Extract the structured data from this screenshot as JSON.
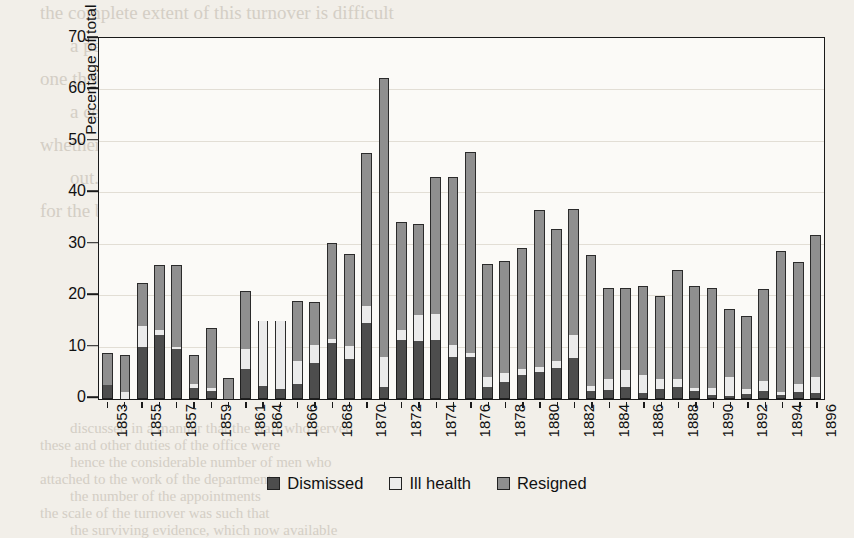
{
  "chart_data": {
    "type": "bar",
    "subtype": "stacked-vertical",
    "title": "",
    "xlabel": "",
    "ylabel": "Percentage of total staff",
    "ylim": [
      0,
      70
    ],
    "ytick_step": 10,
    "yticks": [
      0,
      10,
      20,
      30,
      40,
      50,
      60,
      70
    ],
    "grid": true,
    "grid_axis": "y",
    "legend_position": "bottom",
    "xtick_interval": 2,
    "note_missing_years": [
      1862,
      1863
    ],
    "series": [
      {
        "name": "Dismissed",
        "color": "#4d4d4d",
        "values": [
          2.8,
          0.0,
          10.2,
          12.4,
          9.7,
          2.2,
          1.6,
          0.0,
          5.8,
          2.5,
          2.0,
          3.0,
          7.0,
          10.8,
          7.8,
          14.7,
          2.4,
          11.5,
          11.2,
          11.5,
          8.1,
          8.2,
          2.3,
          3.4,
          4.6,
          5.3,
          6.0,
          8.0,
          1.5,
          1.8,
          2.3,
          1.2,
          2.0,
          2.4,
          1.6,
          0.8,
          0.6,
          1.0,
          1.6,
          0.8,
          1.4,
          1.2
        ]
      },
      {
        "name": "Ill health",
        "color": "#ebebeb",
        "values": [
          0.0,
          1.4,
          4.0,
          1.0,
          0.5,
          0.8,
          0.6,
          0.0,
          4.0,
          12.7,
          13.2,
          4.3,
          3.5,
          0.9,
          2.6,
          3.3,
          5.8,
          2.0,
          5.2,
          5.1,
          2.5,
          0.8,
          2.0,
          1.6,
          1.2,
          1.0,
          1.3,
          4.4,
          1.1,
          2.0,
          3.4,
          3.5,
          1.9,
          1.4,
          0.6,
          1.3,
          3.6,
          1.0,
          2.0,
          0.5,
          1.5,
          3.0
        ]
      },
      {
        "name": "Resigned",
        "color": "#8f8f8f",
        "values": [
          6.2,
          7.1,
          8.3,
          12.6,
          15.8,
          5.5,
          11.6,
          4.0,
          11.2,
          0.0,
          0.0,
          11.7,
          8.3,
          18.6,
          17.8,
          29.8,
          54.3,
          20.9,
          17.6,
          26.6,
          32.6,
          39.0,
          21.9,
          21.8,
          23.6,
          30.4,
          25.8,
          24.6,
          25.4,
          17.8,
          15.9,
          17.3,
          16.1,
          21.2,
          19.8,
          19.4,
          13.3,
          14.2,
          17.7,
          27.5,
          23.7,
          27.7
        ]
      }
    ],
    "categories": [
      "1853",
      "1854",
      "1855",
      "1856",
      "1857",
      "1858",
      "1859",
      "1860",
      "1861",
      "1864",
      "1865",
      "1866",
      "1867",
      "1868",
      "1869",
      "1870",
      "1871",
      "1872",
      "1873",
      "1874",
      "1875",
      "1876",
      "1877",
      "1878",
      "1879",
      "1880",
      "1881",
      "1882",
      "1883",
      "1884",
      "1885",
      "1886",
      "1887",
      "1888",
      "1889",
      "1890",
      "1891",
      "1892",
      "1893",
      "1894",
      "1895",
      "1896"
    ],
    "tick_labels_shown": [
      "1853",
      "",
      "1855",
      "",
      "1857",
      "",
      "1859",
      "",
      "1861",
      "1864",
      "",
      "1866",
      "",
      "1868",
      "",
      "1870",
      "",
      "1872",
      "",
      "1874",
      "",
      "1876",
      "",
      "1878",
      "",
      "1880",
      "",
      "1882",
      "",
      "1884",
      "",
      "1886",
      "",
      "1888",
      "",
      "1890",
      "",
      "1892",
      "",
      "1894",
      "",
      "1896"
    ],
    "totals": [
      9.0,
      8.5,
      22.5,
      26.0,
      26.0,
      8.5,
      13.8,
      4.0,
      21.0,
      15.2,
      15.2,
      19.0,
      18.8,
      30.3,
      28.2,
      47.8,
      62.5,
      34.4,
      34.0,
      43.2,
      43.2,
      48.0,
      26.2,
      26.8,
      29.4,
      36.7,
      33.1,
      37.0,
      28.0,
      21.6,
      21.6,
      22.0,
      20.0,
      25.0,
      22.0,
      21.5,
      17.5,
      16.2,
      21.3,
      28.8,
      26.6,
      31.9
    ]
  },
  "axis": {
    "ylabel": "Percentage of total staff",
    "yticks": [
      "0",
      "10",
      "20",
      "30",
      "40",
      "50",
      "60",
      "70"
    ]
  },
  "legend": {
    "items": [
      {
        "label": "Dismissed",
        "swatch": "dark-gray-swatch"
      },
      {
        "label": "Ill health",
        "swatch": "light-gray-swatch"
      },
      {
        "label": "Resigned",
        "swatch": "medium-gray-swatch"
      }
    ]
  },
  "page_bleed": {
    "lines": [
      "the complete extent of this turnover is difficult",
      "a period of change and the figures for",
      "one that the authority effectively confirmed that a major",
      "a certain premium given to promote junior staff",
      "whether other kinds of pressure might have",
      "out. It was supposed that they were generally appointed",
      "for the body of the establishment, and in",
      "discussed in a manner that the staff who served",
      "these and other duties of the office were",
      "hence the considerable number of men who",
      "attached to the work of the department",
      "the number of the appointments",
      "the scale of the turnover was such that",
      "the surviving evidence, which now available"
    ]
  }
}
